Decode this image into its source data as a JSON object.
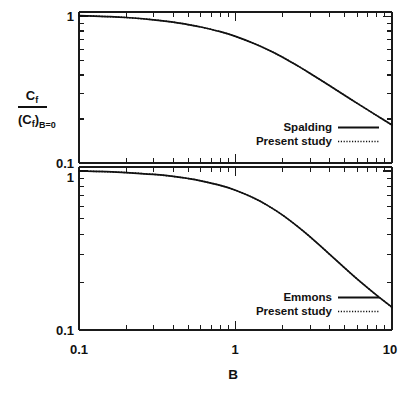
{
  "figure": {
    "y_axis_label": {
      "numerator": "C",
      "numerator_sub": "f",
      "denominator_open": "(C",
      "denominator_sub": "f",
      "denominator_close": ")",
      "denominator_cond": "B=0"
    },
    "x_axis_label": "B",
    "x_tick_labels": [
      "0.1",
      "1",
      "10"
    ],
    "panel_top_y_tick_labels": [
      "1",
      "0.1"
    ],
    "panel_bottom_y_tick_labels": [
      "1",
      "0.1"
    ]
  },
  "chart_data": [
    {
      "type": "line",
      "panel": "top",
      "title": "",
      "xlabel": "B",
      "ylabel": "Cf / (Cf)B=0",
      "xscale": "log",
      "yscale": "log",
      "xlim": [
        0.1,
        10
      ],
      "ylim": [
        0.1,
        1.08
      ],
      "xticks": [
        0.1,
        1,
        10
      ],
      "xticklabels": [
        "0.1",
        "1",
        "10"
      ],
      "yticks": [
        0.1,
        1
      ],
      "yticklabels": [
        "0.1",
        "1"
      ],
      "grid": false,
      "legend_position": "lower right",
      "series": [
        {
          "name": "Spalding",
          "style": "solid",
          "color": "#111111",
          "x": [
            0.1,
            0.15,
            0.2,
            0.3,
            0.4,
            0.5,
            0.6,
            0.8,
            1.0,
            1.3,
            1.6,
            2.0,
            2.5,
            3.0,
            4.0,
            5.0,
            6.0,
            8.0,
            10.0
          ],
          "y": [
            1.02,
            1.005,
            0.99,
            0.955,
            0.92,
            0.885,
            0.853,
            0.792,
            0.735,
            0.66,
            0.598,
            0.53,
            0.462,
            0.41,
            0.338,
            0.29,
            0.256,
            0.211,
            0.182
          ]
        },
        {
          "name": "Present study",
          "style": "dotted",
          "color": "#111111",
          "x": [
            0.1,
            0.15,
            0.2,
            0.3,
            0.4,
            0.5,
            0.6,
            0.8,
            1.0,
            1.3,
            1.6,
            2.0,
            2.5,
            3.0,
            4.0,
            5.0,
            6.0,
            8.0,
            10.0
          ],
          "y": [
            1.02,
            1.005,
            0.99,
            0.955,
            0.92,
            0.885,
            0.853,
            0.792,
            0.735,
            0.66,
            0.598,
            0.53,
            0.462,
            0.41,
            0.338,
            0.29,
            0.256,
            0.211,
            0.182
          ]
        }
      ]
    },
    {
      "type": "line",
      "panel": "bottom",
      "title": "",
      "xlabel": "B",
      "ylabel": "Cf / (Cf)B=0",
      "xscale": "log",
      "yscale": "log",
      "xlim": [
        0.1,
        10
      ],
      "ylim": [
        0.1,
        1.06
      ],
      "xticks": [
        0.1,
        1,
        10
      ],
      "xticklabels": [
        "0.1",
        "1",
        "10"
      ],
      "yticks": [
        0.1,
        1
      ],
      "yticklabels": [
        "0.1",
        "1"
      ],
      "grid": false,
      "legend_position": "lower right",
      "series": [
        {
          "name": "Emmons",
          "style": "solid",
          "color": "#111111",
          "x": [
            0.1,
            0.15,
            0.2,
            0.3,
            0.4,
            0.5,
            0.6,
            0.8,
            1.0,
            1.3,
            1.6,
            2.0,
            2.5,
            3.0,
            4.0,
            5.0,
            6.0,
            8.0,
            10.0
          ],
          "y": [
            1.0,
            0.99,
            0.978,
            0.952,
            0.925,
            0.897,
            0.868,
            0.812,
            0.757,
            0.678,
            0.608,
            0.528,
            0.447,
            0.385,
            0.299,
            0.245,
            0.209,
            0.165,
            0.139
          ]
        },
        {
          "name": "Present study",
          "style": "dotted",
          "color": "#111111",
          "x": [
            0.1,
            0.15,
            0.2,
            0.3,
            0.4,
            0.5,
            0.6,
            0.8,
            1.0,
            1.3,
            1.6,
            2.0,
            2.5,
            3.0,
            4.0,
            5.0,
            6.0,
            8.0,
            10.0
          ],
          "y": [
            1.0,
            0.99,
            0.978,
            0.952,
            0.925,
            0.897,
            0.868,
            0.812,
            0.757,
            0.678,
            0.608,
            0.528,
            0.447,
            0.385,
            0.299,
            0.245,
            0.209,
            0.165,
            0.139
          ]
        }
      ]
    }
  ],
  "legends": {
    "top": [
      {
        "label": "Spalding",
        "style": "solid"
      },
      {
        "label": "Present study",
        "style": "dotted"
      }
    ],
    "bottom": [
      {
        "label": "Emmons",
        "style": "solid"
      },
      {
        "label": "Present study",
        "style": "dotted"
      }
    ]
  }
}
